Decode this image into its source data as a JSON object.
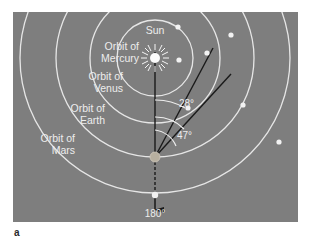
{
  "figure": {
    "caption": "a",
    "background_color": "#ffffff",
    "panel_color": "#7e7e7e",
    "orbit_stroke_color": "#e6e6e6",
    "sightline_color": "#1a1a1a",
    "planet_dot_color": "#f2f2f2",
    "earth_dot_color": "#b8b0a0",
    "label_color": "#ededed"
  },
  "diagram": {
    "type": "solar-system-elongation-diagram",
    "sun_label": "Sun",
    "orbits": [
      {
        "name": "mercury",
        "label": "Orbit of Mercury",
        "radius": 38
      },
      {
        "name": "venus",
        "label": "Orbit of Venus",
        "radius": 65
      },
      {
        "name": "earth",
        "label": "Orbit of Earth",
        "radius": 99
      },
      {
        "name": "mars",
        "label": "Orbit of Mars",
        "radius": 135
      }
    ],
    "orbit_labels": {
      "mercury_line1": "Orbit of",
      "mercury_line2": "Mercury",
      "venus_line1": "Orbit of",
      "venus_line2": "Venus",
      "earth_line1": "Orbit of",
      "earth_line2": "Earth",
      "mars_line1": "Orbit of",
      "mars_line2": "Mars"
    },
    "angles": [
      {
        "name": "mercury-max-elongation",
        "label": "28°",
        "value": 28
      },
      {
        "name": "venus-max-elongation",
        "label": "47°",
        "value": 47
      },
      {
        "name": "opposition",
        "label": "180°",
        "value": 180
      }
    ]
  }
}
